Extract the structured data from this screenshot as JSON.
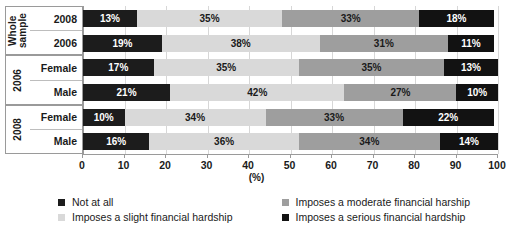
{
  "chart_data": {
    "type": "bar",
    "orientation": "horizontal",
    "stacked": true,
    "percent": true,
    "title": "",
    "xlabel": "(%)",
    "ylabel": "",
    "xlim": [
      0,
      100
    ],
    "xticks": [
      0,
      10,
      20,
      30,
      40,
      50,
      60,
      70,
      80,
      90,
      100
    ],
    "grid": true,
    "legend_position": "bottom",
    "series": [
      {
        "name": "Not at all",
        "color": "#1c1c1c",
        "values": [
          13,
          19,
          17,
          21,
          10,
          16
        ]
      },
      {
        "name": "Imposes a slight financial hardship",
        "color": "#d9d9d9",
        "values": [
          35,
          38,
          35,
          42,
          34,
          36
        ]
      },
      {
        "name": "Imposes a moderate financial harship",
        "color": "#9e9e9e",
        "values": [
          33,
          31,
          35,
          27,
          33,
          34
        ]
      },
      {
        "name": "Imposes a serious financial hardship",
        "color": "#121212",
        "values": [
          18,
          11,
          13,
          10,
          22,
          14
        ]
      }
    ],
    "categories": [
      "2008",
      "2006",
      "Female",
      "Male",
      "Female",
      "Male"
    ],
    "groups": [
      {
        "name": "Whole\nsample",
        "rows": [
          "2008",
          "2006"
        ]
      },
      {
        "name": "2006",
        "rows": [
          "Female",
          "Male"
        ]
      },
      {
        "name": "2008",
        "rows": [
          "Female",
          "Male"
        ]
      }
    ],
    "rows": [
      {
        "group": "Whole sample",
        "label": "2008",
        "values": [
          13,
          35,
          33,
          18
        ],
        "labels": [
          "13%",
          "35%",
          "33%",
          "18%"
        ]
      },
      {
        "group": "Whole sample",
        "label": "2006",
        "values": [
          19,
          38,
          31,
          11
        ],
        "labels": [
          "19%",
          "38%",
          "31%",
          "11%"
        ]
      },
      {
        "group": "2006",
        "label": "Female",
        "values": [
          17,
          35,
          35,
          13
        ],
        "labels": [
          "17%",
          "35%",
          "35%",
          "13%"
        ]
      },
      {
        "group": "2006",
        "label": "Male",
        "values": [
          21,
          42,
          27,
          10
        ],
        "labels": [
          "21%",
          "42%",
          "27%",
          "10%"
        ]
      },
      {
        "group": "2008",
        "label": "Female",
        "values": [
          10,
          34,
          33,
          22
        ],
        "labels": [
          "10%",
          "34%",
          "33%",
          "22%"
        ]
      },
      {
        "group": "2008",
        "label": "Male",
        "values": [
          16,
          36,
          34,
          14
        ],
        "labels": [
          "16%",
          "36%",
          "34%",
          "14%"
        ]
      }
    ]
  },
  "axis": {
    "tick_labels": [
      "0",
      "10",
      "20",
      "30",
      "40",
      "50",
      "60",
      "70",
      "80",
      "90",
      "100"
    ],
    "unit_label": "(%)"
  },
  "legend": {
    "items": [
      {
        "label": "Not at all",
        "color": "#1c1c1c"
      },
      {
        "label": "Imposes a moderate financial harship",
        "color": "#9e9e9e"
      },
      {
        "label": "Imposes a slight financial hardship",
        "color": "#d9d9d9"
      },
      {
        "label": "Imposes a serious financial hardship",
        "color": "#121212"
      }
    ]
  }
}
